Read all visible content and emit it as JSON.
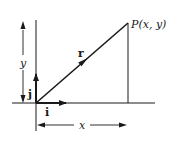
{
  "diagram": {
    "type": "position-vector",
    "labels": {
      "point": "P(x, y)",
      "vector": "r",
      "unit_i": "i",
      "unit_j": "j",
      "x_dim": "x",
      "y_dim": "y"
    },
    "colors": {
      "line": "#1a1a1a",
      "background": "#ffffff"
    }
  }
}
